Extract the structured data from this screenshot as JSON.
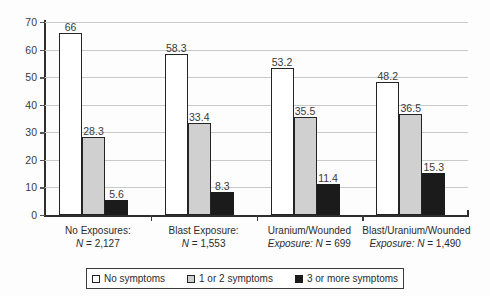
{
  "chart_data": {
    "type": "bar",
    "title": "",
    "subtitle": "",
    "xlabel": "",
    "ylabel": "",
    "ylim": [
      0,
      70
    ],
    "ytick_step": 10,
    "yticks": [
      "0",
      "10",
      "20",
      "30",
      "40",
      "50",
      "60",
      "70"
    ],
    "grid": "horizontal",
    "legend_position": "bottom",
    "categories": [
      "No Exposures: N = 2,127",
      "Blast Exposure: N = 1,553",
      "Uranium/Wounded Exposure: N = 699",
      "Blast/Uranium/Wounded Exposure: N = 1,490"
    ],
    "category_lines": [
      {
        "line1": "No Exposures:",
        "line2_prefix": "N",
        "line2_rest": " = 2,127"
      },
      {
        "line1": "Blast Exposure:",
        "line2_prefix": "N",
        "line2_rest": " = 1,553"
      },
      {
        "line1": "Uranium/Wounded",
        "line2_prefix": "Exposure: N",
        "line2_rest": " = 699"
      },
      {
        "line1": "Blast/Uranium/Wounded",
        "line2_prefix": "Exposure: N",
        "line2_rest": " = 1,490"
      }
    ],
    "series": [
      {
        "name": "No symptoms",
        "color": "#ffffff",
        "values": [
          66,
          58.3,
          53.2,
          48.2
        ],
        "labels": [
          "66",
          "58.3",
          "53.2",
          "48.2"
        ]
      },
      {
        "name": "1 or 2 symptoms",
        "color": "#d0d0d0",
        "values": [
          28.3,
          33.4,
          35.5,
          36.5
        ],
        "labels": [
          "28.3",
          "33.4",
          "35.5",
          "36.5"
        ]
      },
      {
        "name": "3 or more symptoms",
        "color": "#1b1b1b",
        "values": [
          5.6,
          8.3,
          11.4,
          15.3
        ],
        "labels": [
          "5.6",
          "8.3",
          "11.4",
          "15.3"
        ]
      }
    ]
  },
  "legend": {
    "items": [
      {
        "label": "No symptoms"
      },
      {
        "label": "1 or 2 symptoms"
      },
      {
        "label": "3 or more symptoms"
      }
    ]
  }
}
